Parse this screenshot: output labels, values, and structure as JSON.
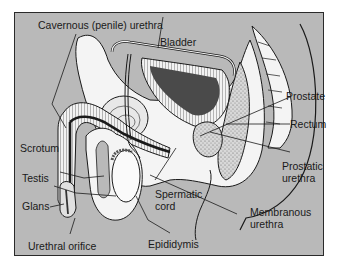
{
  "diagram": {
    "type": "anatomical-cross-section",
    "colors": {
      "background": "#b9b9b9",
      "tissue": "#f4f4f4",
      "bladder_lumen": "#4a4a4a",
      "outline": "#1a1a1a"
    },
    "labels": {
      "cavernous_urethra": "Cavernous (penile) urethra",
      "bladder": "Bladder",
      "prostate": "Prostate",
      "rectum": "Rectum",
      "scrotum": "Scrotum",
      "testis": "Testis",
      "glans": "Glans",
      "spermatic_cord_1": "Spermatic",
      "spermatic_cord_2": "cord",
      "prostatic_urethra_1": "Prostatic",
      "prostatic_urethra_2": "urethra",
      "membranous_urethra_1": "Membranous",
      "membranous_urethra_2": "urethra",
      "urethral_orifice": "Urethral orifice",
      "epididymis": "Epididymis"
    }
  }
}
